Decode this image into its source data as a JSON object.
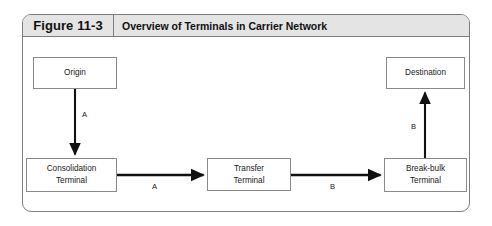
{
  "figure": {
    "number_label": "Figure 11-3",
    "title": "Overview of Terminals in Carrier Network"
  },
  "diagram": {
    "type": "flow-diagram",
    "nodes": [
      {
        "id": "origin",
        "label_lines": [
          "Origin"
        ]
      },
      {
        "id": "consolidation",
        "label_lines": [
          "Consolidation",
          "Terminal"
        ]
      },
      {
        "id": "transfer",
        "label_lines": [
          "Transfer",
          "Terminal"
        ]
      },
      {
        "id": "breakbulk",
        "label_lines": [
          "Break-bulk",
          "Terminal"
        ]
      },
      {
        "id": "destination",
        "label_lines": [
          "Destination"
        ]
      }
    ],
    "edges": [
      {
        "from": "origin",
        "to": "consolidation",
        "label": "A",
        "direction": "down"
      },
      {
        "from": "consolidation",
        "to": "transfer",
        "label": "A",
        "direction": "right"
      },
      {
        "from": "transfer",
        "to": "breakbulk",
        "label": "B",
        "direction": "right"
      },
      {
        "from": "breakbulk",
        "to": "destination",
        "label": "B",
        "direction": "up"
      }
    ]
  },
  "colors": {
    "frame_border": "#7d7d7d",
    "header_background": "#e4e4e4",
    "node_border": "#8a8a8a",
    "arrow": "#111111",
    "text": "#1a1a1a",
    "page_background": "#ffffff"
  }
}
